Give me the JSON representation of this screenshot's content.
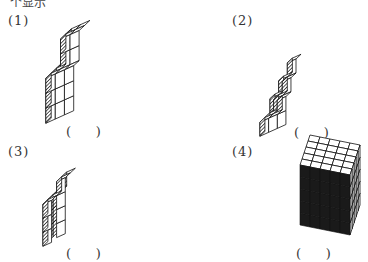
{
  "header": {
    "cut_text": "个显示"
  },
  "figures": [
    {
      "label": "(1)",
      "answer_blank": "(      )"
    },
    {
      "label": "(2)",
      "answer_blank": "(      )"
    },
    {
      "label": "(3)",
      "answer_blank": "(      )"
    },
    {
      "label": "(4)",
      "answer_blank": "(      )"
    }
  ],
  "colors": {
    "stroke": "#111111",
    "hatch": "#333333",
    "background": "#ffffff"
  }
}
